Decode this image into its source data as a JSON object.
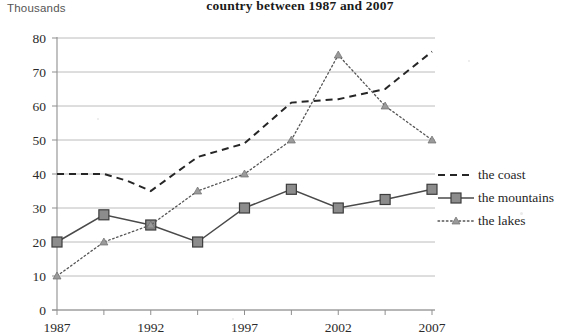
{
  "unit_label": "Thousands",
  "title": "country between 1987 and 2007",
  "legend": {
    "position": "right",
    "items": [
      {
        "label": "the coast",
        "style": "dashed",
        "marker": "none"
      },
      {
        "label": "the mountains",
        "style": "solid",
        "marker": "square"
      },
      {
        "label": "the lakes",
        "style": "dotted",
        "marker": "triangle"
      }
    ]
  },
  "chart_data": {
    "type": "line",
    "title": "country between 1987 and 2007",
    "xlabel": "",
    "ylabel": "Thousands",
    "ylim": [
      0,
      80
    ],
    "ytick_step": 10,
    "yticks": [
      0,
      10,
      20,
      30,
      40,
      50,
      60,
      70,
      80
    ],
    "xlim": [
      1987,
      2007
    ],
    "xticks_labeled": [
      1987,
      1992,
      1997,
      2002,
      2007
    ],
    "xticks_minor_step": 2.5,
    "grid": "horizontal",
    "x": [
      1987,
      1989.5,
      1992,
      1994.5,
      1997,
      1999.5,
      2002,
      2004.5,
      2007
    ],
    "series": [
      {
        "name": "the coast",
        "style": "dashed",
        "marker": "none",
        "x": [
          1987,
          1988.25,
          1989.5,
          1990.75,
          1992,
          1993.25,
          1994.5,
          1995.75,
          1997,
          1999.5,
          2002,
          2004.5,
          2007
        ],
        "values": [
          40,
          40,
          40,
          38,
          35,
          40,
          45,
          47,
          49,
          61,
          62,
          65,
          76
        ]
      },
      {
        "name": "the mountains",
        "style": "solid",
        "marker": "square",
        "x": [
          1987,
          1989.5,
          1992,
          1994.5,
          1997,
          1999.5,
          2002,
          2004.5,
          2007
        ],
        "values": [
          20,
          28,
          25,
          20,
          30,
          35.5,
          30,
          32.5,
          35.5
        ]
      },
      {
        "name": "the lakes",
        "style": "dotted",
        "marker": "triangle",
        "x": [
          1987,
          1989.5,
          1992,
          1994.5,
          1997,
          1999.5,
          2002,
          2004.5,
          2007
        ],
        "values": [
          10,
          20,
          25,
          35,
          40,
          50,
          75,
          60,
          50
        ]
      }
    ]
  }
}
